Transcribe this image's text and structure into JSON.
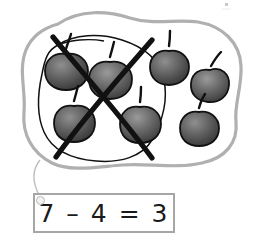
{
  "illustration": {
    "title": "subtraction-apples-grouping",
    "outer_group": {
      "name": "apple-set-outline",
      "shape": "blob",
      "stroke_color": "#b0b0b0",
      "total_items": 7
    },
    "inner_group": {
      "name": "crossed-out-subset-loop",
      "shape": "hand-drawn-loop",
      "stroke_color": "#111111",
      "items_enclosed": 4,
      "cross_out": {
        "name": "cross-out-x",
        "stroke_color": "#111111",
        "label": "X"
      }
    },
    "apples": [
      {
        "label": "apple",
        "in_group": true,
        "crossed_out": true,
        "cx": 66,
        "cy": 71,
        "rx": 21,
        "ry": 17,
        "stem_angle": -16
      },
      {
        "label": "apple",
        "in_group": true,
        "crossed_out": true,
        "cx": 110,
        "cy": 79,
        "rx": 21,
        "ry": 18,
        "stem_angle": -10
      },
      {
        "label": "apple",
        "in_group": true,
        "crossed_out": true,
        "cx": 74,
        "cy": 122,
        "rx": 20,
        "ry": 17,
        "stem_angle": -14
      },
      {
        "label": "apple",
        "in_group": true,
        "crossed_out": true,
        "cx": 140,
        "cy": 123,
        "rx": 20,
        "ry": 18,
        "stem_angle": -4
      },
      {
        "label": "apple",
        "in_group": false,
        "crossed_out": false,
        "cx": 169,
        "cy": 66,
        "rx": 19,
        "ry": 16,
        "stem_angle": -4
      },
      {
        "label": "apple",
        "in_group": false,
        "crossed_out": false,
        "cx": 210,
        "cy": 85,
        "rx": 19,
        "ry": 17,
        "stem_angle": 24
      },
      {
        "label": "apple",
        "in_group": false,
        "crossed_out": false,
        "cx": 199,
        "cy": 128,
        "rx": 19,
        "ry": 17,
        "stem_angle": 10
      }
    ],
    "apple_colors": {
      "fill_dark": "#3d3d3d",
      "fill_mid": "#5a5a5a",
      "fill_light": "#8f8f8f",
      "outline": "#111111",
      "stem": "#111111"
    },
    "leader_line": {
      "name": "leader-line",
      "stroke_color": "#b9b9b9"
    },
    "mark_top_right": {
      "name": "registration-mark",
      "color": "#cfcfcf"
    }
  },
  "equation": {
    "name": "equation-box",
    "text": "7 – 4 = 3",
    "minuend": 7,
    "subtrahend": 4,
    "difference": 3,
    "border_color": "#a6a6a6"
  }
}
